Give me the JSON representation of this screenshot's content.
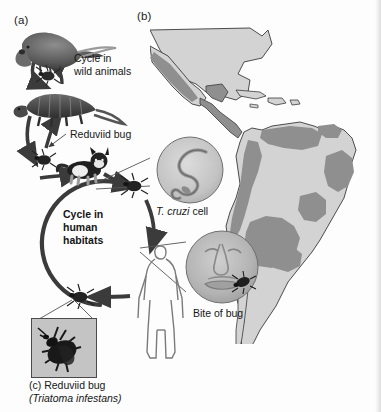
{
  "figure": {
    "background_color": "#fdfdfd",
    "ink_color": "#1a1a1a"
  },
  "panels": {
    "a_label": "(a)",
    "b_label": "(b)",
    "c_label": "(c) Reduviid bug",
    "c_species": "(Triatoma infestans)"
  },
  "cycle_labels": {
    "wild_cycle_line1": "Cycle in",
    "wild_cycle_line2": "wild animals",
    "vector": "Reduviid bug",
    "human_cycle_line1": "Cycle in",
    "human_cycle_line2": "human",
    "human_cycle_line3": "habitats"
  },
  "insets": {
    "parasite_genus": "T. cruzi",
    "parasite_rest": " cell",
    "bite": "Bite of bug"
  },
  "organisms": [
    {
      "name": "opossum",
      "role": "wild reservoir host"
    },
    {
      "name": "armadillo",
      "role": "wild reservoir host"
    },
    {
      "name": "cat",
      "role": "domestic reservoir host"
    },
    {
      "name": "human",
      "role": "host in human habitats"
    },
    {
      "name": "reduviid-bug",
      "role": "insect vector"
    }
  ],
  "map": {
    "region": "Americas",
    "land_color": "#d3d3d3",
    "endemic_color": "#8f8f8f",
    "outline_color": "#3a3a3a",
    "endemic_areas": [
      "Mexico",
      "Central America",
      "Venezuela",
      "Colombia",
      "Ecuador",
      "Peru",
      "Bolivia",
      "Paraguay",
      "northern Argentina",
      "Chile",
      "northeast Brazil",
      "central Brazil"
    ]
  },
  "colors": {
    "arrow_dark": "#3b3b3b",
    "leader_line": "#555555",
    "circle_fill": "#c9c9c9",
    "photo_border": "#4a4a4a"
  }
}
